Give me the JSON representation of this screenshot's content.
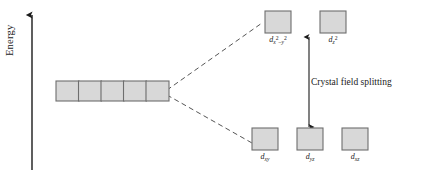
{
  "figure": {
    "type": "crystal-field-splitting-diagram",
    "background_color": "#ffffff",
    "line_color": "#1a1a1a",
    "box_fill_color": "#d8d8d8",
    "box_stroke_color": "#6e6e6e"
  },
  "axis": {
    "label": "Energy",
    "direction": "up"
  },
  "annotation": {
    "text": "Crystal field splitting"
  },
  "degenerate_set": {
    "count": 5,
    "label": ""
  },
  "upper_level": {
    "orbitals": [
      {
        "base": "d",
        "sub": "x",
        "sup1": "2",
        "op": "–",
        "sub2": "y",
        "sup2": "2",
        "name": "dx2-y2"
      },
      {
        "base": "d",
        "sub": "z",
        "sup1": "2",
        "name": "dz2"
      }
    ]
  },
  "lower_level": {
    "orbitals": [
      {
        "base": "d",
        "sub": "xy",
        "name": "dxy"
      },
      {
        "base": "d",
        "sub": "yz",
        "name": "dyz"
      },
      {
        "base": "d",
        "sub": "xz",
        "name": "dxz"
      }
    ]
  }
}
